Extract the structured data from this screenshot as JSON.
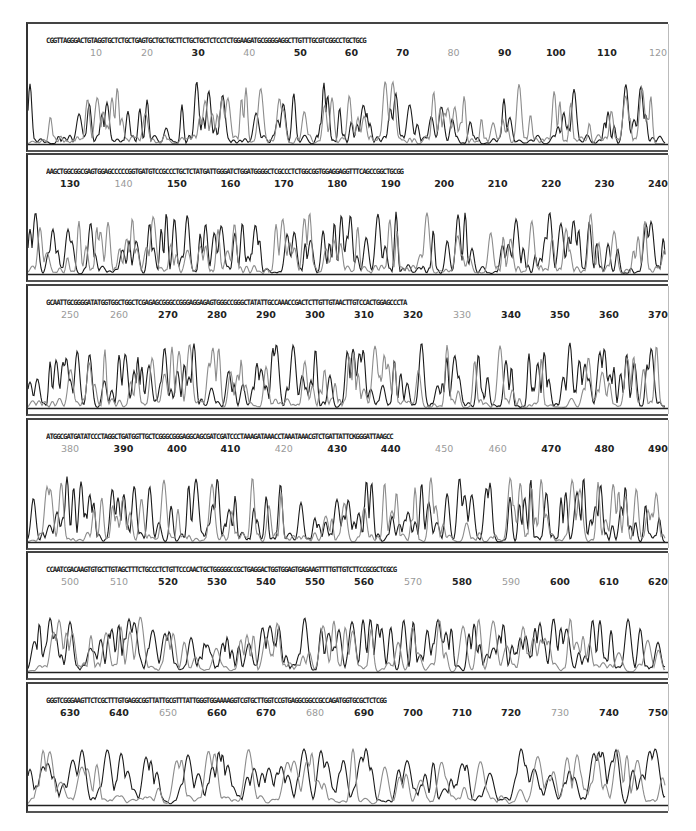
{
  "chart_data": {
    "type": "line",
    "xlabel": "Base position",
    "ylabel": "Fluorescence intensity",
    "grid": false,
    "legend": null,
    "series_colors": {
      "dark": "#1a1a1a",
      "light": "#8c8c8c"
    },
    "panels": [
      {
        "range": [
          1,
          120
        ],
        "sequence": "CGGTTAGGGACTGTAGGTGCTCTGCTGAGTGCTGCTGCTTCTGCTGCTCTCCTCTGGAAGATGCGGGGAGGCTTGTTTGCGTCGGCCTGCTGCG",
        "ticks": [
          {
            "label": "10",
            "gray": true
          },
          {
            "label": "20",
            "gray": true
          },
          {
            "label": "30",
            "gray": false
          },
          {
            "label": "40",
            "gray": true
          },
          {
            "label": "50",
            "gray": false
          },
          {
            "label": "60",
            "gray": false
          },
          {
            "label": "70",
            "gray": false
          },
          {
            "label": "80",
            "gray": true
          },
          {
            "label": "90",
            "gray": false
          },
          {
            "label": "100",
            "gray": false
          },
          {
            "label": "110",
            "gray": false
          },
          {
            "label": "120",
            "gray": true
          }
        ]
      },
      {
        "range": [
          121,
          245
        ],
        "sequence": "AAGCTGGCGGCGAGTGGAGCCCCCGGTGATGTCCGCCCTGCTCTATGATTGGGATCTGGATGGGGCTCGCCCTCTGGCGGTGGAGGAGGTTTCAGCCGGCTGCGG",
        "ticks": [
          {
            "label": "130",
            "gray": false
          },
          {
            "label": "140",
            "gray": true
          },
          {
            "label": "150",
            "gray": false
          },
          {
            "label": "160",
            "gray": false
          },
          {
            "label": "170",
            "gray": false
          },
          {
            "label": "180",
            "gray": false
          },
          {
            "label": "190",
            "gray": false
          },
          {
            "label": "200",
            "gray": false
          },
          {
            "label": "210",
            "gray": false
          },
          {
            "label": "220",
            "gray": false
          },
          {
            "label": "230",
            "gray": false
          },
          {
            "label": "240",
            "gray": false
          }
        ]
      },
      {
        "range": [
          246,
          372
        ],
        "sequence": "GCAATTGCGGGGATATGGTGGCTGGCTCGAGAGCGGGCCGGGAGGAGAGTGGGCCGGGCTATATTGCCAAACCGACTCTTGTTGTAACTTGTCCACTGGAGCCCTA",
        "ticks": [
          {
            "label": "250",
            "gray": true
          },
          {
            "label": "260",
            "gray": true
          },
          {
            "label": "270",
            "gray": false
          },
          {
            "label": "280",
            "gray": false
          },
          {
            "label": "290",
            "gray": false
          },
          {
            "label": "300",
            "gray": false
          },
          {
            "label": "310",
            "gray": false
          },
          {
            "label": "320",
            "gray": false
          },
          {
            "label": "330",
            "gray": true
          },
          {
            "label": "340",
            "gray": false
          },
          {
            "label": "350",
            "gray": false
          },
          {
            "label": "360",
            "gray": false
          },
          {
            "label": "370",
            "gray": false
          }
        ]
      },
      {
        "range": [
          373,
          497
        ],
        "sequence": "ATGGCGATGATATCCCTAGGCTGATGGTTGCTCGGGCGGGAGGCAGCGATCGATCCCTAAAGATAAACCTAAATAAACGTCTGATTATTCKGGGATTAAGCC",
        "ticks": [
          {
            "label": "380",
            "gray": true
          },
          {
            "label": "390",
            "gray": false
          },
          {
            "label": "400",
            "gray": false
          },
          {
            "label": "410",
            "gray": false
          },
          {
            "label": "420",
            "gray": true
          },
          {
            "label": "430",
            "gray": false
          },
          {
            "label": "440",
            "gray": false
          },
          {
            "label": "450",
            "gray": true
          },
          {
            "label": "460",
            "gray": true
          },
          {
            "label": "470",
            "gray": false
          },
          {
            "label": "480",
            "gray": false
          },
          {
            "label": "490",
            "gray": false
          }
        ]
      },
      {
        "range": [
          498,
          623
        ],
        "sequence": "CCAATCGACAAGTGTGCTTGTAGCTTTCTGCCCTCTGTTCCCAACTGCTGGGGGCCGCTGAGGACTGGTGGAGTGAGAAGTTTTGTTGTCTTCCGCGCTCGCG",
        "ticks": [
          {
            "label": "500",
            "gray": true
          },
          {
            "label": "510",
            "gray": true
          },
          {
            "label": "520",
            "gray": false
          },
          {
            "label": "530",
            "gray": false
          },
          {
            "label": "540",
            "gray": false
          },
          {
            "label": "550",
            "gray": false
          },
          {
            "label": "560",
            "gray": false
          },
          {
            "label": "570",
            "gray": true
          },
          {
            "label": "580",
            "gray": false
          },
          {
            "label": "590",
            "gray": true
          },
          {
            "label": "600",
            "gray": false
          },
          {
            "label": "610",
            "gray": false
          },
          {
            "label": "620",
            "gray": false
          }
        ]
      },
      {
        "range": [
          624,
          752
        ],
        "sequence": "GGGTCGGGAAGTTCTCGCTTTGTGAGGCGGTTATTGCGTTTATTGGGTGGAAAAGGTCGTGCTTGGTCCGTGAGGCGGCCGCCAGATGGTGCGCTCTCGG",
        "ticks": [
          {
            "label": "630",
            "gray": false
          },
          {
            "label": "640",
            "gray": false
          },
          {
            "label": "650",
            "gray": true
          },
          {
            "label": "660",
            "gray": false
          },
          {
            "label": "670",
            "gray": false
          },
          {
            "label": "680",
            "gray": true
          },
          {
            "label": "690",
            "gray": false
          },
          {
            "label": "700",
            "gray": false
          },
          {
            "label": "710",
            "gray": false
          },
          {
            "label": "720",
            "gray": false
          },
          {
            "label": "730",
            "gray": true
          },
          {
            "label": "740",
            "gray": false
          },
          {
            "label": "750",
            "gray": false
          }
        ]
      }
    ]
  }
}
